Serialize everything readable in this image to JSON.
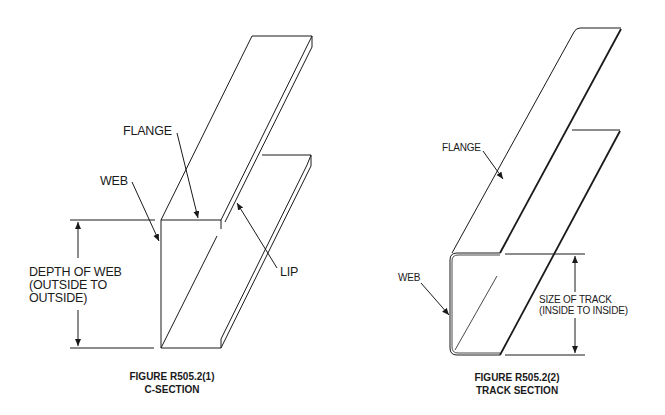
{
  "figures": [
    {
      "id": "c-section",
      "caption_line1": "FIGURE R505.2(1)",
      "caption_line2": "C-SECTION",
      "labels": {
        "flange": "FLANGE",
        "web": "WEB",
        "lip": "LIP",
        "dimension_line1": "DEPTH OF WEB",
        "dimension_line2": "(OUTSIDE TO",
        "dimension_line3": "OUTSIDE)"
      }
    },
    {
      "id": "track-section",
      "caption_line1": "FIGURE R505.2(2)",
      "caption_line2": "TRACK SECTION",
      "labels": {
        "flange": "FLANGE",
        "web": "WEB",
        "dimension_line1": "SIZE OF TRACK",
        "dimension_line2": "(INSIDE TO INSIDE)"
      }
    }
  ],
  "colors": {
    "line": "#1a1a1a",
    "background": "#ffffff"
  }
}
